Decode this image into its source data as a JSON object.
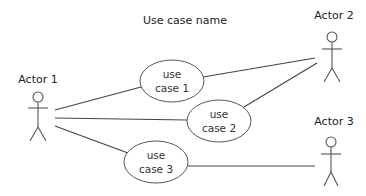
{
  "diagram": {
    "type": "uml-use-case",
    "title": "Use case name",
    "colors": {
      "line": "#444444",
      "text": "#222222",
      "background": "#ffffff"
    },
    "actors": [
      {
        "id": "actor1",
        "label": "Actor 1"
      },
      {
        "id": "actor2",
        "label": "Actor 2"
      },
      {
        "id": "actor3",
        "label": "Actor 3"
      }
    ],
    "use_cases": [
      {
        "id": "uc1",
        "line1": "use",
        "line2": "case 1"
      },
      {
        "id": "uc2",
        "line1": "use",
        "line2": "case 2"
      },
      {
        "id": "uc3",
        "line1": "use",
        "line2": "case 3"
      }
    ],
    "associations": [
      {
        "from": "actor1",
        "to": "uc1"
      },
      {
        "from": "actor1",
        "to": "uc2"
      },
      {
        "from": "actor1",
        "to": "uc3"
      },
      {
        "from": "uc1",
        "to": "actor2"
      },
      {
        "from": "uc2",
        "to": "actor2"
      },
      {
        "from": "uc3",
        "to": "actor3"
      }
    ]
  }
}
